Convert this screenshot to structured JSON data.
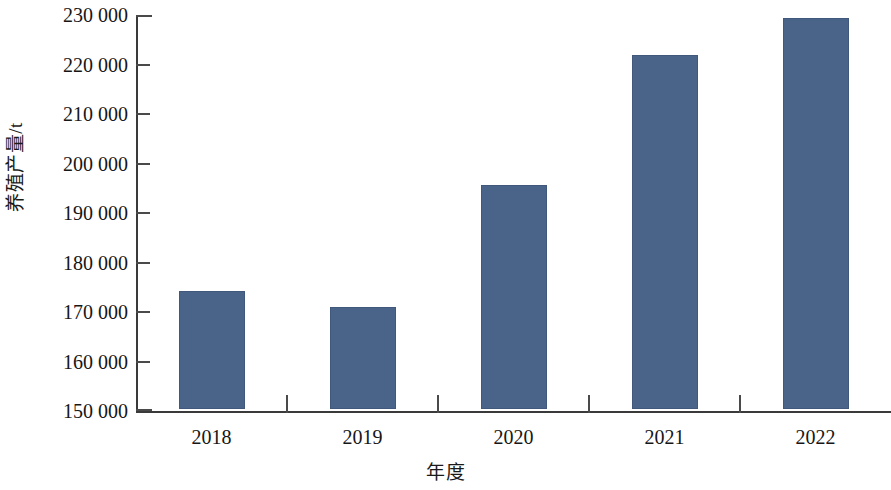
{
  "chart_data": {
    "type": "bar",
    "title": "",
    "xlabel": "年度",
    "ylabel": "养殖产量/t",
    "categories": [
      "2018",
      "2019",
      "2020",
      "2021",
      "2022"
    ],
    "values": [
      173800,
      170600,
      195300,
      221500,
      229000
    ],
    "series": [
      {
        "name": "养殖产量",
        "values": [
          173800,
          170600,
          195300,
          221500,
          229000
        ]
      }
    ],
    "ylim": [
      150000,
      230000
    ],
    "y_tick_step": 10000,
    "y_tick_labels": [
      "230 000",
      "220 000",
      "210 000",
      "200 000",
      "190 000",
      "180 000",
      "170 000",
      "160 000",
      "150 000"
    ],
    "y_tick_values": [
      230000,
      220000,
      210000,
      200000,
      190000,
      180000,
      170000,
      160000,
      150000
    ],
    "grid": false,
    "legend": false,
    "legend_position": "none",
    "bar_color": "#4a6489",
    "axis_color": "#3a3a3a"
  }
}
